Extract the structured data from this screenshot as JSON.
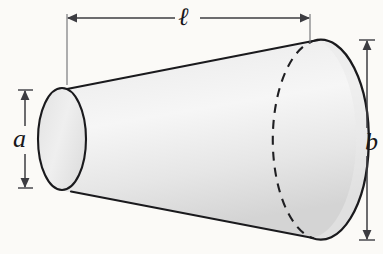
{
  "figure": {
    "kind": "conical-frustum-diagram",
    "caption_labels": {
      "length": "ℓ",
      "small_radius": "a",
      "large_radius": "b"
    },
    "colors": {
      "background": "#fbfaf7",
      "outline": "#1a1a1d",
      "surface_light": "#f2f2f2",
      "surface_mid": "#e3e3e3",
      "surface_dark": "#d2d2d2",
      "dimension_line": "#4a4a4f"
    },
    "geometry": {
      "left_ellipse": {
        "cx": 62,
        "cy": 139,
        "rx": 24,
        "ry": 51
      },
      "right_ellipse": {
        "cx": 300,
        "cy": 139,
        "rx": 48,
        "ry": 100
      },
      "top_slant": {
        "x1": 68,
        "y1": 89,
        "x2": 317,
        "y2": 40
      },
      "bottom_slant": {
        "x1": 72,
        "y1": 192,
        "x2": 312,
        "y2": 238
      },
      "hidden_arc_dasharray": "9 7"
    },
    "dimensions": [
      {
        "name": "length",
        "label": "ℓ",
        "orientation": "horizontal",
        "axis_position": 18,
        "from": 67,
        "to": 310,
        "extension_from": 17,
        "extension_to": 84
      },
      {
        "name": "small-radius",
        "label": "a",
        "orientation": "vertical",
        "axis_position": 25,
        "from": 90,
        "to": 188
      },
      {
        "name": "large-radius",
        "label": "b",
        "orientation": "vertical",
        "axis_position": 367,
        "from": 40,
        "to": 240
      }
    ],
    "bleed_through": [
      {
        "text": "the surface area",
        "left": 196,
        "top": 106
      },
      {
        "text": "of a frustum",
        "left": 182,
        "top": 136
      },
      {
        "text": "is given by",
        "left": 160,
        "top": 158
      },
      {
        "text": "revolution",
        "left": 210,
        "top": 62
      }
    ]
  }
}
